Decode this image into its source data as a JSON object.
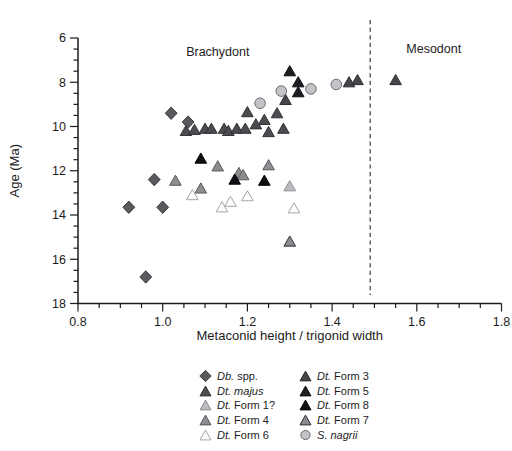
{
  "figure": {
    "background": "#ffffff",
    "ink_color": "#1c1c1c",
    "boundary_line_color": "#4a4a4a"
  },
  "chart_data": {
    "type": "scatter",
    "title": "",
    "xlabel": "Metaconid height / trigonid width",
    "ylabel": "Age (Ma)",
    "xlim": [
      0.8,
      1.8
    ],
    "ylim": [
      6,
      18
    ],
    "y_axis_inverted": true,
    "grid": false,
    "x_tick_labels": [
      "0.8",
      "1.0",
      "1.2",
      "1.4",
      "1.6",
      "1.8"
    ],
    "y_tick_labels": [
      "6",
      "8",
      "10",
      "12",
      "14",
      "16",
      "18"
    ],
    "x_major_step": 0.2,
    "x_minor_step": 0.05,
    "y_major_step": 2,
    "y_minor_step": 0.5,
    "boundary_line": {
      "x": 1.49,
      "style": "dashed"
    },
    "region_labels": [
      {
        "id": "brachydont",
        "text": "Brachydont",
        "x": 1.13,
        "y": 6.8
      },
      {
        "id": "mesodont",
        "text": "Mesodont",
        "x": 1.64,
        "y": 6.7
      }
    ],
    "legend": {
      "position": "bottom",
      "columns": 2
    },
    "series": [
      {
        "id": "db-spp",
        "label_italic": "Db.",
        "label_roman": "spp.",
        "marker": "diamond",
        "fill": "#5a5a5e",
        "stroke": "#3a3a3e",
        "legend_column": 1,
        "points": [
          [
            1.02,
            9.4
          ],
          [
            1.06,
            9.8
          ],
          [
            0.98,
            12.4
          ],
          [
            0.92,
            13.65
          ],
          [
            1.0,
            13.65
          ],
          [
            0.96,
            16.8
          ]
        ]
      },
      {
        "id": "dt-majus",
        "label_italic": "Dt. majus",
        "label_roman": "",
        "marker": "triangle",
        "fill": "#4c4c50",
        "stroke": "#333336",
        "legend_column": 1,
        "points": [
          [
            1.055,
            10.2
          ],
          [
            1.075,
            10.15
          ],
          [
            1.1,
            10.1
          ],
          [
            1.115,
            10.1
          ],
          [
            1.145,
            10.1
          ],
          [
            1.155,
            10.2
          ],
          [
            1.175,
            10.1
          ],
          [
            1.195,
            10.1
          ],
          [
            1.2,
            9.35
          ],
          [
            1.22,
            9.9
          ],
          [
            1.24,
            9.7
          ],
          [
            1.25,
            10.25
          ],
          [
            1.27,
            9.4
          ],
          [
            1.285,
            10.1
          ]
        ]
      },
      {
        "id": "dt-form-1",
        "label_italic": "Dt.",
        "label_roman": "Form 1?",
        "marker": "triangle",
        "fill": "#bcbcc0",
        "stroke": "#8e8e92",
        "legend_column": 1,
        "points": [
          [
            1.3,
            12.7
          ]
        ]
      },
      {
        "id": "dt-form-4",
        "label_italic": "Dt.",
        "label_roman": "Form 4",
        "marker": "triangle",
        "fill": "#8e8e92",
        "stroke": "#5a5a5e",
        "legend_column": 1,
        "points": [
          [
            1.03,
            12.45
          ],
          [
            1.09,
            12.8
          ],
          [
            1.13,
            11.8
          ],
          [
            1.18,
            12.1
          ],
          [
            1.19,
            12.2
          ],
          [
            1.25,
            11.75
          ]
        ]
      },
      {
        "id": "dt-form-6",
        "label_italic": "Dt.",
        "label_roman": "Form 6",
        "marker": "triangle",
        "fill": "#fdfdfd",
        "stroke": "#a6a6aa",
        "legend_column": 1,
        "points": [
          [
            1.07,
            13.1
          ],
          [
            1.14,
            13.65
          ],
          [
            1.16,
            13.4
          ],
          [
            1.2,
            13.15
          ],
          [
            1.31,
            13.7
          ]
        ]
      },
      {
        "id": "dt-form-3",
        "label_italic": "Dt.",
        "label_roman": "Form 3",
        "marker": "triangle",
        "fill": "#46464a",
        "stroke": "#2e2e32",
        "legend_column": 2,
        "points": [
          [
            1.29,
            8.8
          ],
          [
            1.44,
            8.0
          ],
          [
            1.46,
            7.9
          ],
          [
            1.55,
            7.9
          ]
        ]
      },
      {
        "id": "dt-form-5",
        "label_italic": "Dt.",
        "label_roman": "Form 5",
        "marker": "triangle",
        "fill": "#1e1e22",
        "stroke": "#111114",
        "legend_column": 2,
        "points": [
          [
            1.3,
            7.5
          ],
          [
            1.32,
            8.0
          ],
          [
            1.32,
            8.45
          ]
        ]
      },
      {
        "id": "dt-form-8",
        "label_italic": "Dt.",
        "label_roman": "Form 8",
        "marker": "triangle",
        "fill": "#101014",
        "stroke": "#060609",
        "legend_column": 2,
        "points": [
          [
            1.09,
            11.45
          ],
          [
            1.17,
            12.4
          ],
          [
            1.24,
            12.45
          ]
        ]
      },
      {
        "id": "dt-form-7",
        "label_italic": "Dt.",
        "label_roman": "Form 7",
        "marker": "triangle",
        "fill": "#8c8c90",
        "stroke": "#303034",
        "legend_column": 2,
        "points": [
          [
            1.3,
            15.2
          ]
        ]
      },
      {
        "id": "s-nagrii",
        "label_italic": "S. nagrii",
        "label_roman": "",
        "marker": "circle",
        "fill": "#c4c4c8",
        "stroke": "#6a6a6e",
        "legend_column": 2,
        "points": [
          [
            1.23,
            8.95
          ],
          [
            1.28,
            8.4
          ],
          [
            1.35,
            8.3
          ],
          [
            1.41,
            8.1
          ]
        ]
      }
    ]
  }
}
